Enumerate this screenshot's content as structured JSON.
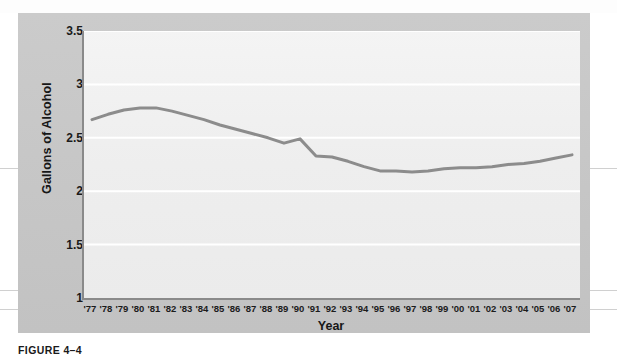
{
  "figure": {
    "caption": "FIGURE 4–4",
    "panel_color": "#c9c9c9",
    "plot_background": "#f2f2f2",
    "line_color": "#8c8c8c",
    "axis_color": "#8a8a8a",
    "gridline_color": "#ffffff"
  },
  "chart_data": {
    "type": "line",
    "title": "",
    "subtitle": "",
    "xlabel": "Year",
    "ylabel": "Gallons of Alcohol",
    "ylim": [
      1,
      3.5
    ],
    "ytick_labels": [
      "3.5",
      "3",
      "2.5",
      "2",
      "1.5",
      "1"
    ],
    "ytick_values": [
      3.5,
      3,
      2.5,
      2,
      1.5,
      1
    ],
    "grid": true,
    "grid_axis": "y",
    "legend": false,
    "legend_position": "none",
    "categories": [
      "'77",
      "'78",
      "'79",
      "'80",
      "'81",
      "'82",
      "'83",
      "'84",
      "'85",
      "'86",
      "'87",
      "'88",
      "'89",
      "'90",
      "'91",
      "'92",
      "'93",
      "'94",
      "'95",
      "'96",
      "'97",
      "'98",
      "'99",
      "'00",
      "'01",
      "'02",
      "'03",
      "'04",
      "'05",
      "'06",
      "'07"
    ],
    "x_values": [
      1977,
      1978,
      1979,
      1980,
      1981,
      1982,
      1983,
      1984,
      1985,
      1986,
      1987,
      1988,
      1989,
      1990,
      1991,
      1992,
      1993,
      1994,
      1995,
      1996,
      1997,
      1998,
      1999,
      2000,
      2001,
      2002,
      2003,
      2004,
      2005,
      2006,
      2007
    ],
    "series": [
      {
        "name": "Gallons of Alcohol",
        "values": [
          2.67,
          2.72,
          2.76,
          2.78,
          2.78,
          2.75,
          2.71,
          2.67,
          2.62,
          2.58,
          2.54,
          2.5,
          2.45,
          2.49,
          2.33,
          2.32,
          2.28,
          2.23,
          2.19,
          2.19,
          2.18,
          2.19,
          2.21,
          2.22,
          2.22,
          2.23,
          2.25,
          2.26,
          2.28,
          2.31,
          2.34
        ]
      }
    ]
  }
}
